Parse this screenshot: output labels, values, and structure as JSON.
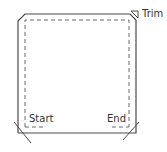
{
  "diagram": {
    "type": "sewing-trim-diagram",
    "labels": {
      "trim": "Trim",
      "start": "Start",
      "end": "End"
    },
    "icons": {
      "trim_marker": "trim-triangle-icon"
    },
    "colors": {
      "outline": "#4a4a4a",
      "dashed": "#6a6a6a",
      "text": "#333333",
      "background": "#ffffff"
    }
  }
}
